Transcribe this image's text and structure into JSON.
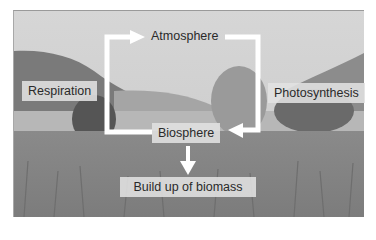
{
  "diagram": {
    "nodes": {
      "atmosphere": "Atmosphere",
      "biosphere": "Biosphere",
      "respiration": "Respiration",
      "photosynthesis": "Photosynthesis",
      "biomass": "Build up of biomass"
    },
    "edges": [
      {
        "from": "biosphere",
        "to": "atmosphere",
        "label": "Respiration"
      },
      {
        "from": "atmosphere",
        "to": "biosphere",
        "label": "Photosynthesis"
      },
      {
        "from": "biosphere",
        "to": "biomass",
        "label": ""
      }
    ],
    "background": "grayscale landscape photo: lake, hills, trees, meadow grass"
  }
}
